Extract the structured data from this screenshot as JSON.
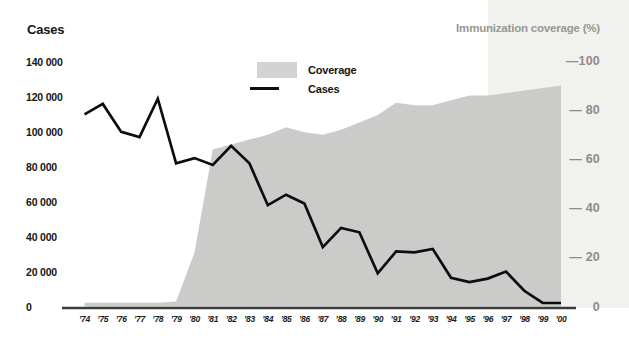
{
  "title_left": "Cases",
  "title_right": "Immunization coverage (%)",
  "legend": [
    {
      "label": "Coverage",
      "type": "area"
    },
    {
      "label": "Cases",
      "type": "line"
    }
  ],
  "left_axis": {
    "ticks": [
      "140 000",
      "120 000",
      "100 000",
      "80 000",
      "60 000",
      "40 000",
      "20 000",
      "0"
    ]
  },
  "right_axis": {
    "ticks": [
      "—100",
      "— 80",
      "— 60",
      "— 40",
      "— 20",
      "0"
    ]
  },
  "chart_data": {
    "type": "area+line",
    "x": [
      "’74",
      "’75",
      "’76",
      "’77",
      "’78",
      "’79",
      "’80",
      "’81",
      "’82",
      "’83",
      "’84",
      "’85",
      "’86",
      "’87",
      "’88",
      "’89",
      "’90",
      "’91",
      "’92",
      "’93",
      "’94",
      "’95",
      "’96",
      "’97",
      "’98",
      "’99",
      "’00"
    ],
    "series": [
      {
        "name": "Coverage",
        "type": "area",
        "axis": "right",
        "unit": "%",
        "values": [
          1.5,
          1.5,
          1.5,
          1.5,
          1.5,
          2,
          22,
          64,
          66,
          68,
          70,
          73,
          71,
          70,
          72,
          75,
          78,
          83,
          82,
          82,
          84,
          86,
          86,
          87,
          88,
          89,
          90
        ]
      },
      {
        "name": "Cases",
        "type": "line",
        "axis": "left",
        "unit": "cases",
        "values": [
          110000,
          116000,
          100000,
          97000,
          119000,
          82000,
          85000,
          81000,
          92000,
          82000,
          58000,
          64000,
          59000,
          34000,
          45000,
          42500,
          19000,
          31500,
          31000,
          33000,
          16500,
          14000,
          16000,
          20000,
          9000,
          2000,
          2000
        ]
      }
    ],
    "left_ylabel": "Cases",
    "right_ylabel": "Immunization coverage (%)",
    "left_ylim": [
      0,
      140000
    ],
    "right_ylim": [
      0,
      100
    ],
    "grid": false,
    "legend_position": "top-center"
  },
  "colors": {
    "coverage_area": "#cbcbc9",
    "legend_swatch": "#d3d3d1",
    "cases_line": "#0d0d0d",
    "axis_line": "#3c3c3c",
    "right_band": "#f1f1ee",
    "right_text": "#8c8c89",
    "right_title_text": "#98988f"
  }
}
